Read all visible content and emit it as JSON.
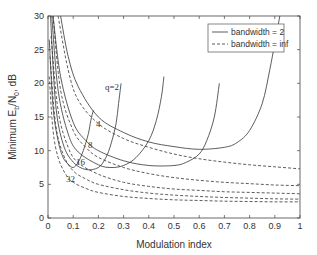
{
  "chart_data": {
    "type": "line",
    "title": "",
    "xlabel": "Modulation index",
    "ylabel": "Minimum E_b/N_0, dB",
    "xlim": [
      0,
      1
    ],
    "ylim": [
      0,
      30
    ],
    "xticks": [
      "0",
      "0.1",
      "0.2",
      "0.3",
      "0.4",
      "0.5",
      "0.6",
      "0.7",
      "0.8",
      "0.9",
      "1"
    ],
    "yticks": [
      "0",
      "5",
      "10",
      "15",
      "20",
      "25",
      "30"
    ],
    "grid": false,
    "legend": {
      "position": "upper right",
      "entries": [
        {
          "label": "bandwidth = 2",
          "style": "solid"
        },
        {
          "label": "bandwidth = inf",
          "style": "dashed"
        }
      ]
    },
    "annotations": [
      "q=2",
      "4",
      "8",
      "16",
      "32"
    ],
    "series": [
      {
        "name": "q=2, bandwidth = 2",
        "style": "solid",
        "x": [
          0.05,
          0.08,
          0.12,
          0.2,
          0.3,
          0.4,
          0.5,
          0.6,
          0.7,
          0.75,
          0.8,
          0.85,
          0.88,
          0.9,
          0.92
        ],
        "y": [
          30,
          24,
          19.5,
          15,
          12.7,
          11.3,
          10.6,
          10.2,
          10.5,
          11.2,
          13,
          17,
          22,
          26,
          30
        ]
      },
      {
        "name": "q=4, bandwidth = 2",
        "style": "solid",
        "x": [
          0.02,
          0.05,
          0.1,
          0.15,
          0.2,
          0.3,
          0.4,
          0.5,
          0.55,
          0.6,
          0.63,
          0.66,
          0.68
        ],
        "y": [
          30,
          21,
          14.2,
          11.5,
          10,
          8.5,
          7.8,
          7.8,
          8.3,
          9.5,
          11.5,
          15,
          20
        ]
      },
      {
        "name": "q=8, bandwidth = 2",
        "style": "solid",
        "x": [
          0.015,
          0.04,
          0.08,
          0.12,
          0.2,
          0.25,
          0.3,
          0.35,
          0.4,
          0.43,
          0.45,
          0.46
        ],
        "y": [
          30,
          19,
          12.5,
          9.8,
          7.9,
          7.5,
          7.8,
          9,
          11.5,
          14.5,
          18,
          21
        ]
      },
      {
        "name": "q=16, bandwidth = 2",
        "style": "solid",
        "x": [
          0.01,
          0.03,
          0.06,
          0.1,
          0.15,
          0.2,
          0.23,
          0.25,
          0.27,
          0.28,
          0.29
        ],
        "y": [
          30,
          17,
          11,
          8.3,
          7.2,
          7.5,
          9,
          11,
          14,
          17,
          20
        ]
      },
      {
        "name": "q=32, bandwidth = 2",
        "style": "solid",
        "x": [
          0.005,
          0.02,
          0.04,
          0.06,
          0.08,
          0.1,
          0.12,
          0.14,
          0.16,
          0.17,
          0.18
        ],
        "y": [
          26.5,
          16.5,
          11.5,
          9,
          8,
          7.5,
          8.3,
          10,
          12.5,
          14.5,
          16
        ]
      },
      {
        "name": "q=2, bandwidth = inf",
        "style": "dashed",
        "x": [
          0.04,
          0.08,
          0.12,
          0.2,
          0.3,
          0.4,
          0.5,
          0.6,
          0.7,
          0.8,
          0.9,
          1.0
        ],
        "y": [
          30,
          22,
          17.5,
          14,
          11.8,
          10.5,
          9.5,
          8.8,
          8.3,
          7.9,
          7.6,
          7.3
        ]
      },
      {
        "name": "q=4, bandwidth = inf",
        "style": "dashed",
        "x": [
          0.02,
          0.05,
          0.1,
          0.15,
          0.2,
          0.3,
          0.4,
          0.5,
          0.6,
          0.7,
          0.8,
          0.9,
          1.0
        ],
        "y": [
          30,
          19,
          13,
          10.5,
          9,
          7.5,
          6.6,
          6,
          5.6,
          5.3,
          5.1,
          4.9,
          4.8
        ]
      },
      {
        "name": "q=8, bandwidth = inf",
        "style": "dashed",
        "x": [
          0.012,
          0.04,
          0.08,
          0.12,
          0.2,
          0.3,
          0.4,
          0.5,
          0.6,
          0.7,
          0.8,
          0.9,
          1.0
        ],
        "y": [
          27,
          16,
          10.5,
          8.2,
          6.5,
          5.3,
          4.7,
          4.3,
          4.1,
          3.9,
          3.8,
          3.7,
          3.6
        ]
      },
      {
        "name": "q=16, bandwidth = inf",
        "style": "dashed",
        "x": [
          0.008,
          0.03,
          0.06,
          0.1,
          0.15,
          0.2,
          0.3,
          0.4,
          0.5,
          0.6,
          0.7,
          0.8,
          0.9,
          1.0
        ],
        "y": [
          24,
          14,
          9.5,
          7,
          5.8,
          5,
          4.2,
          3.7,
          3.4,
          3.2,
          3.05,
          2.95,
          2.85,
          2.8
        ]
      },
      {
        "name": "q=32, bandwidth = inf",
        "style": "dashed",
        "x": [
          0.005,
          0.02,
          0.04,
          0.07,
          0.1,
          0.15,
          0.2,
          0.3,
          0.4,
          0.5,
          0.6,
          0.7,
          0.8,
          0.9,
          1.0
        ],
        "y": [
          21,
          13,
          9,
          6.5,
          5.3,
          4.4,
          3.8,
          3.2,
          2.9,
          2.7,
          2.6,
          2.5,
          2.45,
          2.4,
          2.4
        ]
      }
    ]
  }
}
